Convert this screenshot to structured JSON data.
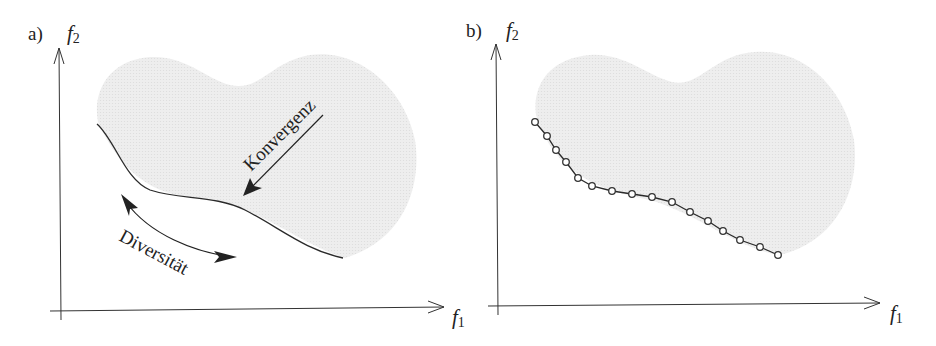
{
  "panels": [
    {
      "id": "a",
      "label": "a)",
      "y_axis_label": "f",
      "y_axis_sub": "2",
      "x_axis_label": "f",
      "x_axis_sub": "1",
      "annotations": {
        "convergence": "Konvergenz",
        "diversity": "Diversität"
      }
    },
    {
      "id": "b",
      "label": "b)",
      "y_axis_label": "f",
      "y_axis_sub": "2",
      "x_axis_label": "f",
      "x_axis_sub": "1",
      "points": [
        [
          535,
          122
        ],
        [
          547,
          136
        ],
        [
          556,
          150
        ],
        [
          566,
          162
        ],
        [
          578,
          178
        ],
        [
          592,
          186
        ],
        [
          612,
          191
        ],
        [
          632,
          194
        ],
        [
          652,
          197
        ],
        [
          672,
          202
        ],
        [
          690,
          212
        ],
        [
          708,
          221
        ],
        [
          723,
          231
        ],
        [
          740,
          240
        ],
        [
          760,
          247
        ],
        [
          778,
          255
        ]
      ]
    }
  ],
  "colors": {
    "region_fill": "#ececec",
    "line": "#2a2a2a"
  }
}
